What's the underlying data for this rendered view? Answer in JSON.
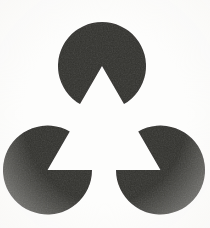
{
  "figure": {
    "canvas": {
      "width": 210,
      "height": 228,
      "background_color": "#fdfdfc"
    },
    "shape_color": "#32302f",
    "illusory_figure": {
      "name": "illusory-triangle",
      "visible_outline": false,
      "vertices": [
        {
          "x": 102,
          "y": 66
        },
        {
          "x": 47.5,
          "y": 170
        },
        {
          "x": 160.5,
          "y": 170
        }
      ]
    },
    "inducers": [
      {
        "name": "top-disc",
        "label": "Top pac-man inducer",
        "center_x": 102,
        "center_y": 66,
        "radius": 44,
        "notch_angle_deg": 60,
        "notch_bisector_deg": 90,
        "notch_direction": "down"
      },
      {
        "name": "bottom-left-disc",
        "label": "Bottom-left pac-man inducer",
        "center_x": 47.5,
        "center_y": 170,
        "radius": 44.5,
        "notch_angle_deg": 60,
        "notch_bisector_deg": 330,
        "notch_direction": "up-right"
      },
      {
        "name": "bottom-right-disc",
        "label": "Bottom-right pac-man inducer",
        "center_x": 160.5,
        "center_y": 170,
        "radius": 44.5,
        "notch_angle_deg": 60,
        "notch_bisector_deg": 210,
        "notch_direction": "up-left"
      }
    ]
  }
}
